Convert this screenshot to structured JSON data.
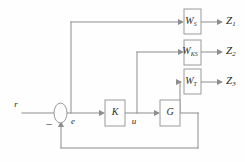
{
  "diagram": {
    "type": "control-block-diagram",
    "background_color": "#fefefe",
    "line_color": "#8d8d8d",
    "block_fill": "#fdfdfd",
    "block_stroke": "#9a9a9a",
    "text_color": "#1f1f1f"
  },
  "signals": {
    "reference": "r",
    "error": "e",
    "control": "u",
    "negative_sign": "–"
  },
  "blocks": [
    {
      "id": "Ws",
      "base": "W",
      "subscript": "S",
      "name": "weight-ws-block"
    },
    {
      "id": "Wks",
      "base": "W",
      "subscript": "KS",
      "name": "weight-wks-block"
    },
    {
      "id": "Wt",
      "base": "W",
      "subscript": "T",
      "name": "weight-wt-block"
    },
    {
      "id": "K",
      "base": "K",
      "subscript": "",
      "name": "controller-block"
    },
    {
      "id": "G",
      "base": "G",
      "subscript": "",
      "name": "plant-block"
    }
  ],
  "outputs": [
    {
      "id": "Z1",
      "base": "Z",
      "subscript": "1",
      "from": "Ws"
    },
    {
      "id": "Z2",
      "base": "Z",
      "subscript": "2",
      "from": "Wks"
    },
    {
      "id": "Z3",
      "base": "Z",
      "subscript": "3",
      "from": "Wt"
    }
  ]
}
